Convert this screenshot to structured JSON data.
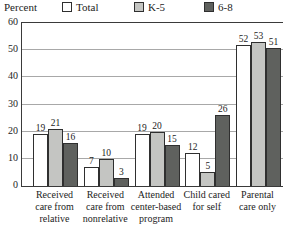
{
  "chart_data": {
    "type": "bar",
    "title": "",
    "ylabel": "Percent",
    "xlabel": "",
    "ylim": [
      0,
      60
    ],
    "yticks": [
      0,
      10,
      20,
      30,
      40,
      50,
      60
    ],
    "gridlines": [
      10,
      20,
      30,
      40,
      50
    ],
    "grid": "on",
    "legend_position": "top",
    "categories": [
      "Received care from relative",
      "Received care from nonrelative",
      "Attended center-based program",
      "Child cared for self",
      "Parental care only"
    ],
    "category_label_lines": [
      [
        "Received",
        "care from",
        "relative"
      ],
      [
        "Received",
        "care from",
        "nonrelative"
      ],
      [
        "Attended",
        "center-based",
        "program"
      ],
      [
        "Child cared",
        "for self"
      ],
      [
        "Parental",
        "care only"
      ]
    ],
    "series": [
      {
        "name": "Total",
        "color": "#ffffff",
        "values": [
          19,
          7,
          19,
          12,
          52
        ]
      },
      {
        "name": "K-5",
        "color": "#c4c5c2",
        "values": [
          21,
          10,
          20,
          5,
          53
        ]
      },
      {
        "name": "6-8",
        "color": "#5f615e",
        "values": [
          16,
          3,
          15,
          26,
          51
        ]
      }
    ]
  },
  "colors": {
    "text": "#1c1c1c",
    "axis": "#3a3a3a",
    "grid": "#a8a8a8",
    "bar_outline": "#2f2f2f",
    "background": "#ffffff"
  }
}
